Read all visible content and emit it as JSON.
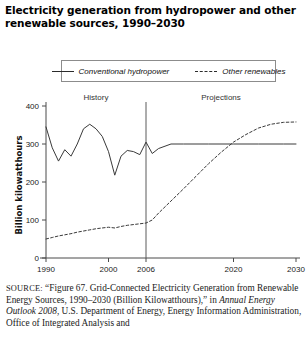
{
  "figure": {
    "title": "Electricity generation from hydropower and other renewable sources, 1990–2030"
  },
  "legend": {
    "position": "top",
    "entries": [
      {
        "label": "Conventional hydropower",
        "style": "solid",
        "icon": "solid-line-icon"
      },
      {
        "label": "Other renewables",
        "style": "dashed",
        "icon": "dashed-line-icon"
      }
    ]
  },
  "annotations": {
    "history_label": "History",
    "projections_label": "Projections",
    "divider_year": 2006
  },
  "source": {
    "prefix": "SOURCE:",
    "line1": "“Figure 67. Grid-Connected Electricity Generation from",
    "line2": "Renewable Energy Sources, 1990–2030 (Billion Kilowatthours),” in",
    "italic_title": "Annual Energy Outlook 2008",
    "line3_rest": ", U.S. Department of Energy, Energy",
    "line4": "Information Administration, Office of Integrated Analysis and"
  },
  "chart_data": {
    "type": "line",
    "title": "Electricity generation from hydropower and other renewable sources, 1990–2030",
    "xlabel": "",
    "ylabel": "Billion kilowatthours",
    "xlim": [
      1990,
      2030
    ],
    "ylim": [
      0,
      400
    ],
    "yticks": [
      0,
      100,
      200,
      300,
      400
    ],
    "ytick_labels": [
      "0",
      "100",
      "200",
      "300",
      "400"
    ],
    "xticks": [
      1990,
      2000,
      2006,
      2020,
      2030
    ],
    "xtick_labels": [
      "1990",
      "2000",
      "2006",
      "2020",
      "2030"
    ],
    "grid": false,
    "legend_position": "above-plot",
    "x": [
      1990,
      1991,
      1992,
      1993,
      1994,
      1995,
      1996,
      1997,
      1998,
      1999,
      2000,
      2001,
      2002,
      2003,
      2004,
      2005,
      2006,
      2007,
      2008,
      2010,
      2012,
      2014,
      2016,
      2018,
      2020,
      2022,
      2024,
      2026,
      2028,
      2030
    ],
    "series": [
      {
        "name": "Conventional hydropower",
        "style": "solid",
        "values": [
          345,
          290,
          255,
          285,
          268,
          300,
          340,
          352,
          340,
          320,
          280,
          218,
          268,
          283,
          280,
          272,
          305,
          275,
          288,
          300,
          300,
          300,
          300,
          300,
          300,
          300,
          300,
          300,
          300,
          300
        ]
      },
      {
        "name": "Other renewables",
        "style": "dashed",
        "values": [
          50,
          54,
          58,
          61,
          64,
          68,
          71,
          74,
          77,
          79,
          81,
          79,
          83,
          86,
          88,
          90,
          92,
          100,
          118,
          150,
          182,
          215,
          248,
          278,
          305,
          325,
          342,
          352,
          357,
          358
        ]
      }
    ],
    "annotations": [
      {
        "text": "History",
        "x": 1997,
        "region": "left-of-divider"
      },
      {
        "text": "Projections",
        "x": 2015,
        "region": "right-of-divider"
      },
      {
        "text": "divider",
        "x": 2006,
        "type": "vertical-line"
      }
    ]
  }
}
